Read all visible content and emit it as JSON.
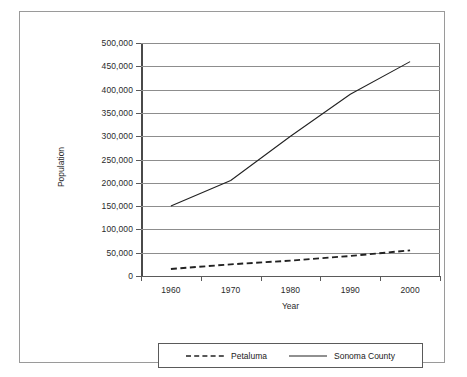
{
  "chart_data": {
    "type": "line",
    "title": "",
    "xlabel": "Year",
    "ylabel": "Population",
    "x": [
      1960,
      1970,
      1980,
      1990,
      2000
    ],
    "xtick_labels": [
      "1960",
      "1970",
      "1980",
      "1990",
      "2000"
    ],
    "ytick_labels": [
      "0",
      "50,000",
      "100,000",
      "150,000",
      "200,000",
      "250,000",
      "300,000",
      "350,000",
      "400,000",
      "450,000",
      "500,000"
    ],
    "ytick_values": [
      0,
      50000,
      100000,
      150000,
      200000,
      250000,
      300000,
      350000,
      400000,
      450000,
      500000
    ],
    "ylim": [
      0,
      500000
    ],
    "xlim": [
      1955,
      2005
    ],
    "grid": "horizontal",
    "legend_position": "bottom",
    "series": [
      {
        "name": "Petaluma",
        "style": "dashed",
        "color": "#222222",
        "values": [
          15000,
          25000,
          33000,
          43000,
          55000
        ]
      },
      {
        "name": "Sonoma County",
        "style": "solid",
        "color": "#222222",
        "values": [
          150000,
          205000,
          300000,
          390000,
          460000
        ]
      }
    ]
  },
  "axes": {
    "y_title": "Population",
    "x_title": "Year"
  },
  "legend": {
    "entries": [
      {
        "label": "Petaluma",
        "style": "dashed"
      },
      {
        "label": "Sonoma County",
        "style": "solid"
      }
    ]
  },
  "colors": {
    "line": "#222222",
    "gridline": "#8d8d8d",
    "axis": "#5a5a5a",
    "frame": "#9a9a9a",
    "background": "#ffffff",
    "text": "#2a2a2a"
  }
}
